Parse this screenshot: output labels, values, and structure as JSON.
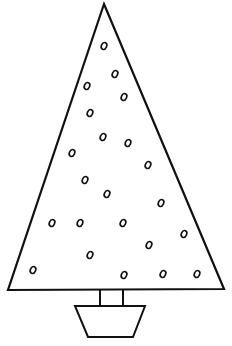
{
  "drawing": {
    "subject": "christmas-tree-outline",
    "stroke_color": "#111111",
    "background": "#ffffff",
    "tree": {
      "apex": [
        104,
        4
      ],
      "base_left": [
        8,
        290
      ],
      "base_right": [
        224,
        289
      ]
    },
    "trunk": {
      "x1": 100,
      "x2": 123,
      "y1": 290,
      "y2": 306
    },
    "pot": {
      "top_left": [
        75,
        306
      ],
      "top_right": [
        145,
        306
      ],
      "bottom_right": [
        133,
        337
      ],
      "bottom_left": [
        88,
        337
      ]
    },
    "ornaments": [
      [
        104,
        46
      ],
      [
        115,
        74
      ],
      [
        87,
        86
      ],
      [
        124,
        97
      ],
      [
        90,
        113
      ],
      [
        103,
        137
      ],
      [
        128,
        143
      ],
      [
        72,
        153
      ],
      [
        148,
        165
      ],
      [
        85,
        180
      ],
      [
        107,
        194
      ],
      [
        161,
        203
      ],
      [
        52,
        223
      ],
      [
        80,
        223
      ],
      [
        123,
        223
      ],
      [
        184,
        234
      ],
      [
        149,
        245
      ],
      [
        90,
        255
      ],
      [
        33,
        270
      ],
      [
        124,
        275
      ],
      [
        163,
        274
      ],
      [
        197,
        274
      ]
    ]
  }
}
